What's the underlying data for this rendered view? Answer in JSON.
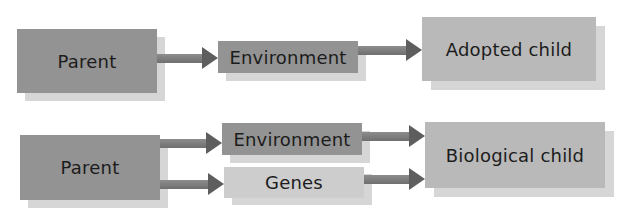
{
  "diagram": {
    "top_row": {
      "parent": "Parent",
      "environment": "Environment",
      "child": "Adopted child"
    },
    "bottom_row": {
      "parent": "Parent",
      "environment": "Environment",
      "genes": "Genes",
      "child": "Biological child"
    }
  },
  "colors": {
    "parent_box": "#939393",
    "environment_box": "#939393",
    "genes_box": "#cdcdcd",
    "child_box": "#b9b9b9",
    "arrow": "#6f6f6f",
    "shadow": "#d6d6d6"
  }
}
